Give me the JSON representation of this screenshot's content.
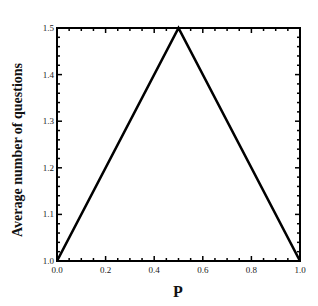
{
  "chart_data": {
    "type": "line",
    "title": "",
    "xlabel": "P",
    "ylabel": "Average number of questions",
    "xlim": [
      0.0,
      1.0
    ],
    "ylim": [
      1.0,
      1.5
    ],
    "x_ticks": [
      "0.0",
      "0.2",
      "0.4",
      "0.6",
      "0.8",
      "1.0"
    ],
    "y_ticks": [
      "1.0",
      "1.1",
      "1.2",
      "1.3",
      "1.4",
      "1.5"
    ],
    "grid": false,
    "legend": null,
    "series": [
      {
        "name": "Average number of questions",
        "x": [
          0.0,
          0.5,
          1.0
        ],
        "y": [
          1.0,
          1.5,
          1.0
        ],
        "color": "#000000"
      }
    ]
  }
}
